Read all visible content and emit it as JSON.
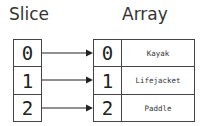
{
  "titles": {
    "slice": "Slice",
    "array": "Array"
  },
  "slice": {
    "indices": [
      "0",
      "1",
      "2"
    ]
  },
  "array": {
    "indices": [
      "0",
      "1",
      "2"
    ],
    "values": [
      "Kayak",
      "Lifejacket",
      "Paddle"
    ]
  },
  "colors": {
    "stroke": "#444444",
    "text": "#222222",
    "background": "#ffffff"
  }
}
